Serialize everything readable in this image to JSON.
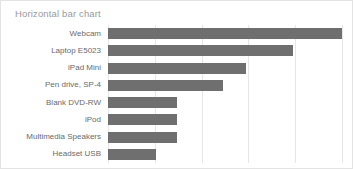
{
  "chart_data": {
    "type": "bar",
    "orientation": "horizontal",
    "title": "Horizontal bar chart",
    "xlabel": "",
    "ylabel": "",
    "categories": [
      "Webcam",
      "Laptop E5023",
      "iPad Mini",
      "Pen drive, SP-4",
      "Blank DVD-RW",
      "iPod",
      "Multimedia Speakers",
      "Headset USB"
    ],
    "values": [
      5.0,
      3.95,
      2.95,
      2.45,
      1.47,
      1.47,
      1.47,
      1.02
    ],
    "xlim": [
      0,
      5.0
    ],
    "gridline_values": [
      0,
      1,
      2,
      3,
      4,
      5
    ],
    "xtick_labels": [],
    "ytick_labels": [
      "Webcam",
      "Laptop E5023",
      "iPad Mini",
      "Pen drive, SP-4",
      "Blank DVD-RW",
      "iPod",
      "Multimedia Speakers",
      "Headset USB"
    ],
    "grid": true,
    "legend": null,
    "bar_color": "#6f6f6f",
    "gridline_color": "#e6e6e6",
    "title_color": "#9a9a9a",
    "label_color": "#6a6a6a",
    "background_color": "#ffffff"
  }
}
